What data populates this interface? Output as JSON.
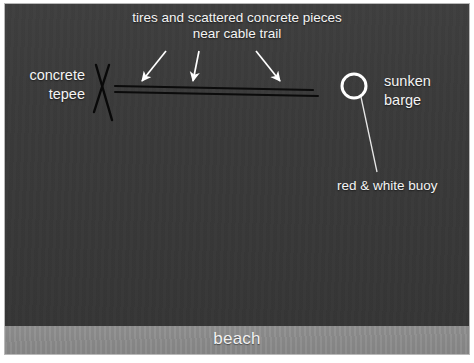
{
  "figure": {
    "domain_note": "annotated underwater survey photograph",
    "width": 474,
    "height": 363
  },
  "colors": {
    "water": "#3b3b3b",
    "beach": "#8a8a8a",
    "annotation_text": "#f4f4f4",
    "arrow_white": "#ffffff",
    "cable_line_black": "#0b0b0b",
    "buoy_outline": "#ffffff",
    "photo_border": "#b9b9b9",
    "page_background": "#ffffff"
  },
  "annotations": {
    "tires": {
      "line1": "tires and scattered concrete pieces",
      "line2": "near cable trail"
    },
    "tepee": {
      "line1": "concrete",
      "line2": "tepee"
    },
    "barge": {
      "line1": "sunken",
      "line2": "barge"
    },
    "buoy": {
      "label": "red & white buoy"
    },
    "beach": {
      "label": "beach"
    }
  },
  "markers": {
    "arrows": [
      {
        "name": "arrow-left",
        "x1": 161,
        "y1": 47,
        "x2": 137,
        "y2": 78
      },
      {
        "name": "arrow-middle",
        "x1": 194,
        "y1": 47,
        "x2": 188,
        "y2": 78
      },
      {
        "name": "arrow-right",
        "x1": 251,
        "y1": 47,
        "x2": 275,
        "y2": 78
      }
    ],
    "cable_lines": [
      {
        "name": "cable-line-upper",
        "x1": 110,
        "y1": 82,
        "x2": 308,
        "y2": 86
      },
      {
        "name": "cable-line-lower",
        "x1": 110,
        "y1": 88,
        "x2": 313,
        "y2": 92
      }
    ],
    "tepee_strokes": [
      {
        "name": "tepee-stroke-a",
        "x1": 91,
        "y1": 61,
        "x2": 107,
        "y2": 116
      },
      {
        "name": "tepee-stroke-b",
        "x1": 104,
        "y1": 61,
        "x2": 89,
        "y2": 108
      }
    ],
    "buoy_circle": {
      "cx": 349,
      "cy": 82,
      "r": 12
    },
    "buoy_leader": {
      "x1": 356,
      "y1": 93,
      "x2": 372,
      "y2": 168
    }
  }
}
